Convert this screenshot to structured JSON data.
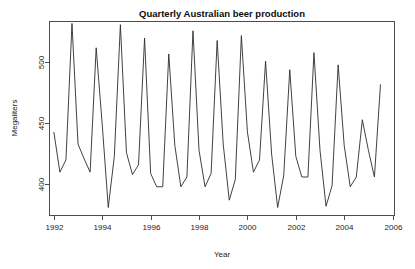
{
  "chart_data": {
    "type": "line",
    "title": "Quarterly Australian beer production",
    "xlabel": "Year",
    "ylabel": "Megaliters",
    "grid": false,
    "legend": "none",
    "xlim": [
      1991.8,
      2006.1
    ],
    "ylim": [
      374,
      534
    ],
    "xticks": [
      1992,
      1994,
      1996,
      1998,
      2000,
      2002,
      2004,
      2006
    ],
    "xtick_labels": [
      "1992",
      "1994",
      "1996",
      "1998",
      "2000",
      "2002",
      "2004",
      "2006"
    ],
    "yticks": [
      400,
      450,
      500
    ],
    "ytick_labels": [
      "400",
      "450",
      "500"
    ],
    "series": [
      {
        "name": "Quarterly beer production",
        "x": [
          1992.0,
          1992.25,
          1992.5,
          1992.75,
          1993.0,
          1993.25,
          1993.5,
          1993.75,
          1994.0,
          1994.25,
          1994.5,
          1994.75,
          1995.0,
          1995.25,
          1995.5,
          1995.75,
          1996.0,
          1996.25,
          1996.5,
          1996.75,
          1997.0,
          1997.25,
          1997.5,
          1997.75,
          1998.0,
          1998.25,
          1998.5,
          1998.75,
          1999.0,
          1999.25,
          1999.5,
          1999.75,
          2000.0,
          2000.25,
          2000.5,
          2000.75,
          2001.0,
          2001.25,
          2001.5,
          2001.75,
          2002.0,
          2002.25,
          2002.5,
          2002.75,
          2003.0,
          2003.25,
          2003.5,
          2003.75,
          2004.0,
          2004.25,
          2004.5,
          2004.75,
          2005.0,
          2005.25,
          2005.5
        ],
        "values": [
          443,
          410,
          420,
          532,
          433,
          421,
          410,
          512,
          449,
          381,
          423,
          531,
          426,
          408,
          416,
          520,
          409,
          398,
          398,
          507,
          432,
          398,
          406,
          526,
          428,
          398,
          409,
          518,
          433,
          387,
          404,
          522,
          443,
          410,
          420,
          501,
          425,
          381,
          407,
          494,
          423,
          406,
          406,
          508,
          428,
          382,
          399,
          498,
          432,
          398,
          406,
          453,
          428,
          406,
          482
        ]
      }
    ],
    "notes": {
      "peak_max": 532,
      "peak_max_period": "1992 Q4",
      "trough_min": 381,
      "trough_min_period": "1994 Q2",
      "last_value": 482,
      "last_period": "2005 Q3",
      "frequency": "quarterly"
    }
  },
  "plot_geometry": {
    "box_left": 49,
    "box_right": 395,
    "box_top": 21,
    "box_bottom": 216
  },
  "colors": {
    "background": "#ffffff",
    "line": "#2b2b2b",
    "axis": "#4d4d4d",
    "text": "#1a1a1a",
    "title": "#0d0d0d"
  }
}
